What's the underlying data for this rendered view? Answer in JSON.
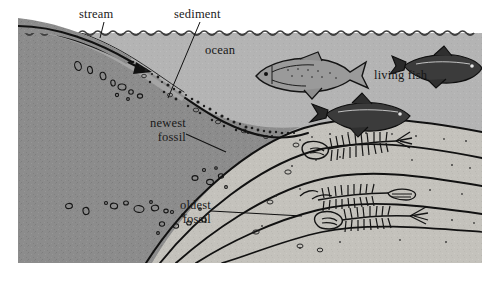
{
  "figure": {
    "labels": {
      "stream": "stream",
      "sediment": "sediment",
      "ocean": "ocean",
      "living_fish": "living fish",
      "newest_fossil_line1": "newest",
      "newest_fossil_line2": "fossil",
      "oldest_fossil_line1": "oldest",
      "oldest_fossil_line2": "fossil"
    },
    "colors": {
      "background": "#ffffff",
      "land_rock": "#8c8c8c",
      "ocean_water": "#b3b3b3",
      "sediment_light": "#d9d6cf",
      "sediment_mid": "#c2c0ba",
      "sediment_pale": "#e6e4de",
      "ink": "#111111"
    },
    "elements": {
      "water_surface": "wavy-line",
      "flow_arrow": "arrow-right",
      "living_fish_count": 3,
      "fossil_fish_count": 3,
      "sediment_layer_count": 4,
      "pebble_clusters": 3
    }
  }
}
